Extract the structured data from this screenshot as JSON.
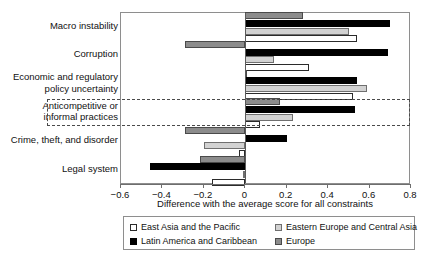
{
  "chart_data": {
    "type": "bar",
    "orientation": "horizontal",
    "title": "",
    "xlabel": "Difference with the average score for all constraints",
    "ylabel": "",
    "xlim": [
      -0.6,
      0.8
    ],
    "xticks": [
      -0.6,
      -0.4,
      -0.2,
      0,
      0.2,
      0.4,
      0.6,
      0.8
    ],
    "xticklabels": [
      "−0.6",
      "−0.4",
      "−0.2",
      "0",
      "0.2",
      "0.4",
      "0.6",
      "0.8"
    ],
    "grid": false,
    "legend_position": "bottom",
    "categories": [
      "Macro instability",
      "Corruption",
      "Economic and regulatory policy uncertainty",
      "Anticompetitive or informal practices",
      "Crime, theft, and disorder",
      "Legal system"
    ],
    "category_lines": [
      [
        "Macro instability"
      ],
      [
        "Corruption"
      ],
      [
        "Economic and regulatory",
        "policy uncertainty"
      ],
      [
        "Anticompetitive or",
        "informal practices"
      ],
      [
        "Crime, theft, and disorder"
      ],
      [
        "Legal system"
      ]
    ],
    "series": [
      {
        "name": "Europe",
        "color": "#8c8c8c",
        "values": [
          0.28,
          -0.29,
          0.0,
          0.17,
          -0.29,
          -0.22
        ]
      },
      {
        "name": "Latin America and Caribbean",
        "color": "#000000",
        "values": [
          0.7,
          0.69,
          0.54,
          0.53,
          0.2,
          -0.46
        ]
      },
      {
        "name": "Eastern Europe and Central Asia",
        "color": "#d2d2d2",
        "values": [
          0.5,
          0.14,
          0.59,
          0.23,
          -0.2,
          -0.01
        ]
      },
      {
        "name": "East Asia and the Pacific",
        "color": "#ffffff",
        "values": [
          0.54,
          0.31,
          0.52,
          0.07,
          -0.03,
          -0.16
        ]
      }
    ],
    "highlighted_category": "Anticompetitive or informal practices",
    "highlight_style": "dashed-box"
  },
  "legend": {
    "items": [
      {
        "label": "East Asia and the Pacific",
        "swatch": "white-square"
      },
      {
        "label": "Eastern Europe and Central Asia",
        "swatch": "light-gray-square"
      },
      {
        "label": "Latin America and Caribbean",
        "swatch": "black-square"
      },
      {
        "label": "Europe",
        "swatch": "gray-square"
      }
    ]
  }
}
